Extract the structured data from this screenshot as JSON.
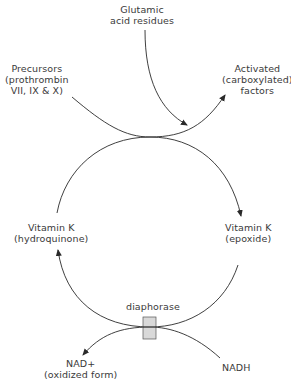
{
  "diagram": {
    "nodes": {
      "glutamic": {
        "line1": "Glutamic",
        "line2": "acid residues"
      },
      "precursors": {
        "line1": "Precursors",
        "line2": "(prothrombin",
        "line3": "VII, IX & X)"
      },
      "activated": {
        "line1": "Activated",
        "line2": "(carboxylated)",
        "line3": "factors"
      },
      "vitk_hydroquinone": {
        "line1": "Vitamin K",
        "line2": "(hydroquinone)"
      },
      "vitk_epoxide": {
        "line1": "Vitamin K",
        "line2": "(epoxide)"
      },
      "diaphorase": {
        "label": "diaphorase"
      },
      "nad": {
        "line1": "NAD+",
        "line2": "(oxidized form)"
      },
      "nadh": {
        "label": "NADH"
      }
    },
    "edges": [
      {
        "from": "Precursors",
        "to": "Activated (carboxylated) factors"
      },
      {
        "from": "Glutamic acid residues",
        "to": "Activated (carboxylated) factors"
      },
      {
        "from": "Vitamin K (hydroquinone)",
        "to": "Vitamin K (epoxide)"
      },
      {
        "from": "Vitamin K (epoxide)",
        "to": "Vitamin K (hydroquinone)",
        "via": "diaphorase"
      },
      {
        "from": "NADH",
        "to": "NAD+ (oxidized form)",
        "via": "diaphorase"
      }
    ],
    "colors": {
      "line": "#2a2a2a",
      "enzyme_box": "#d9d9d9"
    }
  }
}
